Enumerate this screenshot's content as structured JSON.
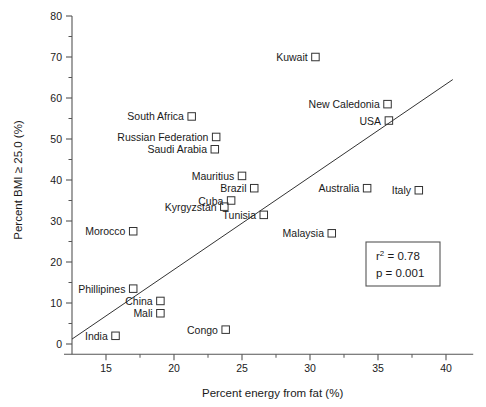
{
  "chart_data": {
    "type": "scatter",
    "title": "",
    "xlabel": "Percent energy from fat (%)",
    "ylabel": "Percent BMI ≥ 25.0 (%)",
    "xlim": [
      12.5,
      42
    ],
    "ylim": [
      -3,
      82
    ],
    "xticks": [
      15,
      20,
      25,
      30,
      35,
      40
    ],
    "xticks_minor": [
      17.5,
      22.5,
      27.5,
      32.5,
      37.5
    ],
    "yticks": [
      0,
      10,
      20,
      30,
      40,
      50,
      60,
      70,
      80
    ],
    "yticks_minor": [
      5,
      15,
      25,
      35,
      45,
      55,
      65,
      75
    ],
    "grid": false,
    "legend": null,
    "marker": "open-square",
    "points": [
      {
        "label": "Kuwait",
        "x": 30.4,
        "y": 70.0,
        "label_side": "left"
      },
      {
        "label": "New Caledonia",
        "x": 35.7,
        "y": 58.5,
        "label_side": "left"
      },
      {
        "label": "USA",
        "x": 35.8,
        "y": 54.5,
        "label_side": "left"
      },
      {
        "label": "South Africa",
        "x": 21.3,
        "y": 55.5,
        "label_side": "left"
      },
      {
        "label": "Russian Federation",
        "x": 23.1,
        "y": 50.5,
        "label_side": "left"
      },
      {
        "label": "Saudi Arabia",
        "x": 23.0,
        "y": 47.5,
        "label_side": "left"
      },
      {
        "label": "Mauritius",
        "x": 25.0,
        "y": 41.0,
        "label_side": "left"
      },
      {
        "label": "Brazil",
        "x": 25.9,
        "y": 38.0,
        "label_side": "left"
      },
      {
        "label": "Australia",
        "x": 34.2,
        "y": 38.0,
        "label_side": "left"
      },
      {
        "label": "Italy",
        "x": 38.0,
        "y": 37.5,
        "label_side": "left"
      },
      {
        "label": "Cuba",
        "x": 24.2,
        "y": 35.0,
        "label_side": "left"
      },
      {
        "label": "Kyrgyzstan",
        "x": 23.7,
        "y": 33.5,
        "label_side": "left"
      },
      {
        "label": "Tunisia",
        "x": 26.6,
        "y": 31.5,
        "label_side": "left"
      },
      {
        "label": "Morocco",
        "x": 17.0,
        "y": 27.5,
        "label_side": "left"
      },
      {
        "label": "Malaysia",
        "x": 31.6,
        "y": 27.0,
        "label_side": "left"
      },
      {
        "label": "Phillipines",
        "x": 17.0,
        "y": 13.5,
        "label_side": "left"
      },
      {
        "label": "China",
        "x": 19.0,
        "y": 10.5,
        "label_side": "left"
      },
      {
        "label": "Mali",
        "x": 19.0,
        "y": 7.5,
        "label_side": "left"
      },
      {
        "label": "Congo",
        "x": 23.8,
        "y": 3.5,
        "label_side": "left"
      },
      {
        "label": "India",
        "x": 15.7,
        "y": 2.0,
        "label_side": "left"
      }
    ],
    "regression_line": {
      "x1": 12.5,
      "y1": 1.2,
      "x2": 40.5,
      "y2": 64.5
    }
  },
  "stats_box": {
    "r_squared_label": "r",
    "r_squared_sup": "2",
    "r_squared_value": " = 0.78",
    "p_value_text": "p = 0.001"
  }
}
